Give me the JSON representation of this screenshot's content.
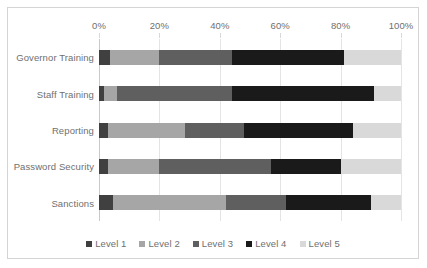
{
  "chart_data": {
    "type": "bar",
    "orientation": "horizontal",
    "stacked": true,
    "stack_mode": "percent",
    "title": "",
    "xlabel": "",
    "ylabel": "",
    "xlim": [
      0,
      100
    ],
    "grid": true,
    "legend_position": "bottom",
    "xticks": [
      {
        "value": 0,
        "label": "0%"
      },
      {
        "value": 20,
        "label": "20%"
      },
      {
        "value": 40,
        "label": "40%"
      },
      {
        "value": 60,
        "label": "60%"
      },
      {
        "value": 80,
        "label": "80%"
      },
      {
        "value": 100,
        "label": "100%"
      }
    ],
    "categories": [
      "Governor Training",
      "Staff Training",
      "Reporting",
      "Password Security",
      "Sanctions"
    ],
    "series": [
      {
        "name": "Level 1",
        "color": "#404040",
        "values": [
          3.5,
          1.5,
          3.0,
          3.0,
          4.5
        ]
      },
      {
        "name": "Level 2",
        "color": "#a6a6a6",
        "values": [
          16.5,
          4.5,
          25.5,
          17.0,
          37.5
        ]
      },
      {
        "name": "Level 3",
        "color": "#5f5f5f",
        "values": [
          24.0,
          38.0,
          19.5,
          37.0,
          20.0
        ]
      },
      {
        "name": "Level 4",
        "color": "#1a1a1a",
        "values": [
          37.0,
          47.0,
          36.0,
          23.0,
          28.0
        ]
      },
      {
        "name": "Level 5",
        "color": "#d9d9d9",
        "values": [
          19.0,
          9.0,
          16.0,
          20.0,
          10.0
        ]
      }
    ]
  },
  "legend": {
    "items": [
      {
        "label": "Level 1",
        "color": "#404040"
      },
      {
        "label": "Level 2",
        "color": "#a6a6a6"
      },
      {
        "label": "Level 3",
        "color": "#5f5f5f"
      },
      {
        "label": "Level 4",
        "color": "#1a1a1a"
      },
      {
        "label": "Level 5",
        "color": "#d9d9d9"
      }
    ]
  },
  "colors": {
    "background": "#ffffff",
    "border": "#d4d4d4",
    "gridline": "#e4e4e4",
    "axis": "#c9c9c9",
    "text": "#6f6f6f"
  }
}
